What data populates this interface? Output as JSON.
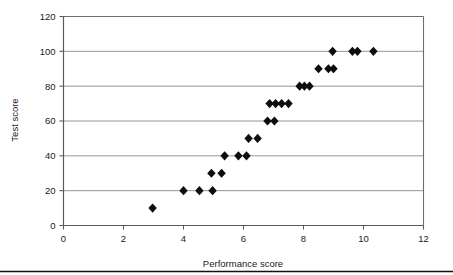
{
  "chart_data": {
    "type": "scatter",
    "title": "",
    "xlabel": "Performance score",
    "ylabel": "Test score",
    "xlim": [
      0,
      12
    ],
    "ylim": [
      0,
      120
    ],
    "xticks": [
      0,
      2,
      4,
      6,
      8,
      10,
      12
    ],
    "yticks": [
      0,
      20,
      40,
      60,
      80,
      100,
      120
    ],
    "xtick_labels": [
      "0",
      "2",
      "4",
      "6",
      "8",
      "10",
      "12"
    ],
    "ytick_labels": [
      "0",
      "20",
      "40",
      "60",
      "80",
      "100",
      "120"
    ],
    "grid": "horizontal",
    "legend": "none",
    "marker": "diamond",
    "marker_color": "#0d0d0d",
    "series": [
      {
        "name": "Performance vs test score",
        "points": [
          [
            2.97,
            10
          ],
          [
            4.0,
            20
          ],
          [
            4.53,
            20
          ],
          [
            4.97,
            20
          ],
          [
            4.93,
            30
          ],
          [
            5.27,
            30
          ],
          [
            5.37,
            40
          ],
          [
            5.83,
            40
          ],
          [
            6.1,
            40
          ],
          [
            6.17,
            50
          ],
          [
            6.47,
            50
          ],
          [
            6.8,
            60
          ],
          [
            7.03,
            60
          ],
          [
            6.87,
            70
          ],
          [
            7.07,
            70
          ],
          [
            7.27,
            70
          ],
          [
            7.5,
            70
          ],
          [
            7.87,
            80
          ],
          [
            8.03,
            80
          ],
          [
            8.2,
            80
          ],
          [
            8.5,
            90
          ],
          [
            8.83,
            90
          ],
          [
            9.0,
            90
          ],
          [
            8.97,
            100
          ],
          [
            9.63,
            100
          ],
          [
            9.8,
            100
          ],
          [
            10.33,
            100
          ]
        ]
      }
    ]
  },
  "figure": {
    "x_axis_title": "Performance score",
    "y_axis_title": "Test score"
  }
}
